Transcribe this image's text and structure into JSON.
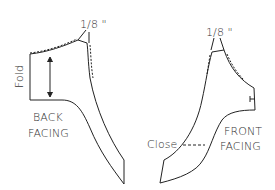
{
  "diagram": {
    "type": "sewing-pattern",
    "pieces": [
      {
        "name": "back-facing",
        "label_line1": "BACK",
        "label_line2": "FACING",
        "fold_label": "Fold",
        "seam_allowance_label": "1/8 \""
      },
      {
        "name": "front-facing",
        "label_line1": "FRONT",
        "label_line2": "FACING",
        "close_label": "Close",
        "seam_allowance_label": "1/8 \""
      }
    ],
    "colors": {
      "line": "#222222",
      "text": "#333333",
      "background": "#ffffff"
    }
  }
}
